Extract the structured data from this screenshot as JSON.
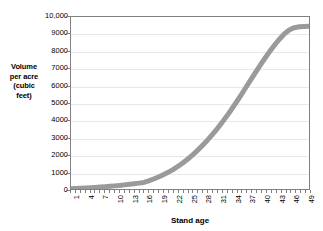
{
  "chart_data": {
    "type": "line",
    "title": "",
    "xlabel": "Stand age",
    "ylabel": "Volume per acre (cubic feet)",
    "ylabel_lines": [
      "Volume",
      "per acre",
      "(cubic",
      "feet)"
    ],
    "xlim": [
      1,
      50
    ],
    "ylim": [
      0,
      10000
    ],
    "grid": true,
    "legend": "none",
    "series_color": "#9a9a9a",
    "gridline_color": "#e8e8e8",
    "axis_color": "#808080",
    "y_ticks": [
      {
        "value": 0,
        "label": "0"
      },
      {
        "value": 1000,
        "label": "1000"
      },
      {
        "value": 2000,
        "label": "2000"
      },
      {
        "value": 3000,
        "label": "3000"
      },
      {
        "value": 4000,
        "label": "4000"
      },
      {
        "value": 5000,
        "label": "5000"
      },
      {
        "value": 6000,
        "label": "6000"
      },
      {
        "value": 7000,
        "label": "7000"
      },
      {
        "value": 8000,
        "label": "8000"
      },
      {
        "value": 9000,
        "label": "9000"
      },
      {
        "value": 10000,
        "label": "10,000"
      }
    ],
    "x_tick_labels": [
      "1",
      "4",
      "7",
      "10",
      "13",
      "16",
      "19",
      "22",
      "25",
      "28",
      "31",
      "34",
      "37",
      "40",
      "43",
      "46",
      "49"
    ],
    "x": [
      1,
      2,
      3,
      4,
      5,
      6,
      7,
      8,
      9,
      10,
      11,
      12,
      13,
      14,
      15,
      16,
      17,
      18,
      19,
      20,
      21,
      22,
      23,
      24,
      25,
      26,
      27,
      28,
      29,
      30,
      31,
      32,
      33,
      34,
      35,
      36,
      37,
      38,
      39,
      40,
      41,
      42,
      43,
      44,
      45,
      46,
      47,
      48,
      49,
      50
    ],
    "values": [
      20,
      30,
      42,
      56,
      72,
      90,
      110,
      132,
      156,
      182,
      210,
      240,
      272,
      306,
      342,
      380,
      470,
      580,
      700,
      830,
      970,
      1130,
      1310,
      1510,
      1730,
      1970,
      2230,
      2510,
      2810,
      3130,
      3470,
      3830,
      4210,
      4610,
      5030,
      5460,
      5900,
      6340,
      6780,
      7210,
      7630,
      8030,
      8400,
      8740,
      9040,
      9260,
      9380,
      9430,
      9450,
      9460
    ]
  },
  "axes": {
    "x_title": "Stand age",
    "y_title_line1": "Volume",
    "y_title_line2": "per acre",
    "y_title_line3": "(cubic",
    "y_title_line4": "feet)"
  }
}
